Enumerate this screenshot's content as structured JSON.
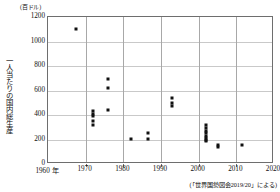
{
  "chart_data": {
    "type": "scatter",
    "title": "",
    "unit_label": "(百ドル)",
    "ylabel": "一人当たりの国内総生産",
    "xlabel": "",
    "xlim": [
      1960,
      2020
    ],
    "ylim": [
      0,
      1200
    ],
    "yticks": [
      0,
      200,
      400,
      600,
      800,
      1000,
      1200
    ],
    "ytick_labels": [
      "0",
      "200",
      "400",
      "600",
      "800",
      "1000",
      "1200"
    ],
    "xticks": [
      1960,
      1970,
      1980,
      1990,
      2000,
      2010,
      2020
    ],
    "xtick_labels": [
      "1960 年",
      "1970",
      "1980",
      "1990",
      "2000",
      "2010",
      "2020"
    ],
    "grid": true,
    "legend": "none",
    "marker": "square",
    "marker_color": "#111111",
    "source": "(「世界国勢図会2019/20」による)",
    "points": [
      {
        "x": 1967.5,
        "y": 1100
      },
      {
        "x": 1972.0,
        "y": 430
      },
      {
        "x": 1972.0,
        "y": 405
      },
      {
        "x": 1972.0,
        "y": 390
      },
      {
        "x": 1972.0,
        "y": 350
      },
      {
        "x": 1972.0,
        "y": 320
      },
      {
        "x": 1976.0,
        "y": 690
      },
      {
        "x": 1976.0,
        "y": 620
      },
      {
        "x": 1976.0,
        "y": 440
      },
      {
        "x": 1982.0,
        "y": 205
      },
      {
        "x": 1986.5,
        "y": 250
      },
      {
        "x": 1986.5,
        "y": 205
      },
      {
        "x": 1993.0,
        "y": 540
      },
      {
        "x": 1993.0,
        "y": 495
      },
      {
        "x": 1993.0,
        "y": 475
      },
      {
        "x": 2002.0,
        "y": 320
      },
      {
        "x": 2002.0,
        "y": 295
      },
      {
        "x": 2002.0,
        "y": 270
      },
      {
        "x": 2002.0,
        "y": 250
      },
      {
        "x": 2002.0,
        "y": 230
      },
      {
        "x": 2002.0,
        "y": 215
      },
      {
        "x": 2002.0,
        "y": 200
      },
      {
        "x": 2002.0,
        "y": 185
      },
      {
        "x": 2005.0,
        "y": 155
      },
      {
        "x": 2005.0,
        "y": 140
      },
      {
        "x": 2011.5,
        "y": 155
      }
    ]
  }
}
